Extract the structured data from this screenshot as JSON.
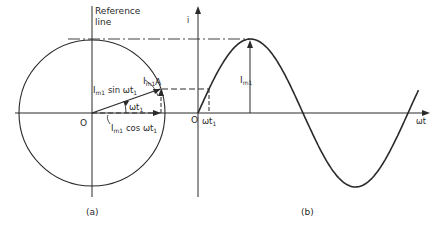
{
  "figure": {
    "panel_a": {
      "caption": "(a)",
      "reference_label_1": "Reference",
      "reference_label_2": "line",
      "origin": "O",
      "point": "A",
      "phasor_I": "I",
      "phasor_sub": "m1",
      "sin_I": "I",
      "sin_sub": "m1",
      "sin_text": " sin ωt",
      "sin_t_sub": "1",
      "angle_text": "ωt",
      "angle_sub": "1",
      "cos_I": "I",
      "cos_sub": "m1",
      "cos_text": " cos ωt",
      "cos_t_sub": "1"
    },
    "panel_b": {
      "caption": "(b)",
      "y_axis": "i",
      "x_axis": "ωt",
      "origin": "O",
      "t1_text": "ωt",
      "t1_sub": "1",
      "amp_I": "I",
      "amp_sub": "m1"
    }
  },
  "chart_data": {
    "type": "line",
    "title": "",
    "xlabel": "ωt",
    "ylabel": "i",
    "series": [
      {
        "name": "i = Im1 sin ωt",
        "function": "sin",
        "amplitude": 1,
        "x_range_cycles": [
          0,
          1.05
        ]
      }
    ],
    "annotations": [
      "Im1",
      "ωt1",
      "O"
    ],
    "phase_angle_t1_deg": 19
  }
}
